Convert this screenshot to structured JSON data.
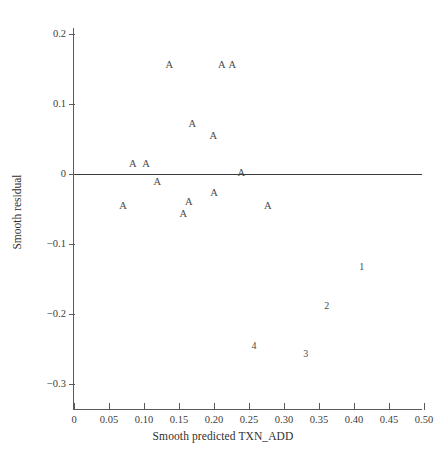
{
  "chart_data": {
    "type": "scatter",
    "title": "",
    "xlabel": "Smooth predicted TXN_ADD",
    "ylabel": "Smooth residual",
    "xlim": [
      0,
      0.5
    ],
    "ylim": [
      -0.33,
      0.22
    ],
    "grid": false,
    "legend": null,
    "x_ticks": [
      "0",
      "0.05",
      "0.10",
      "0.15",
      "0.20",
      "0.25",
      "0.30",
      "0.35",
      "0.40",
      "0.45",
      "0.50"
    ],
    "x_tick_values": [
      0,
      0.05,
      0.1,
      0.15,
      0.2,
      0.25,
      0.3,
      0.35,
      0.4,
      0.45,
      0.5
    ],
    "y_ticks": [
      "0.2",
      "0.1",
      "0",
      "−0.1",
      "−0.2",
      "−0.3"
    ],
    "y_tick_values": [
      0.2,
      0.1,
      0,
      -0.1,
      -0.2,
      -0.3
    ],
    "reference_line": {
      "y": 0,
      "x_start": 0,
      "x_end": 0.497
    },
    "points": [
      {
        "label": "A",
        "x": 0.136,
        "y": 0.154
      },
      {
        "label": "A",
        "x": 0.211,
        "y": 0.154
      },
      {
        "label": "A",
        "x": 0.226,
        "y": 0.154
      },
      {
        "label": "A",
        "x": 0.169,
        "y": 0.07
      },
      {
        "label": "A",
        "x": 0.199,
        "y": 0.053
      },
      {
        "label": "A",
        "x": 0.084,
        "y": 0.013
      },
      {
        "label": "A",
        "x": 0.103,
        "y": 0.013
      },
      {
        "label": "A",
        "x": 0.239,
        "y": 0.0
      },
      {
        "label": "A",
        "x": 0.119,
        "y": -0.013
      },
      {
        "label": "A",
        "x": 0.2,
        "y": -0.029
      },
      {
        "label": "A",
        "x": 0.164,
        "y": -0.041
      },
      {
        "label": "A",
        "x": 0.07,
        "y": -0.047
      },
      {
        "label": "A",
        "x": 0.277,
        "y": -0.047
      },
      {
        "label": "A",
        "x": 0.156,
        "y": -0.059
      },
      {
        "label": "1",
        "x": 0.411,
        "y": -0.134
      },
      {
        "label": "2",
        "x": 0.361,
        "y": -0.19
      },
      {
        "label": "4",
        "x": 0.257,
        "y": -0.247
      },
      {
        "label": "3",
        "x": 0.331,
        "y": -0.259
      }
    ]
  },
  "colors": {
    "axis": "#5a5a5a",
    "text": "#3c3c3c",
    "marker": "#4a4a4a",
    "reference_line": "#3b3b3b",
    "background": "#ffffff"
  }
}
